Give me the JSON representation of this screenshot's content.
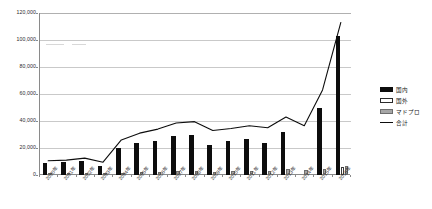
{
  "chart_data": {
    "type": "bar",
    "title": "",
    "subtitle": "",
    "xlabel": "",
    "ylabel": "",
    "ylim": [
      0,
      120000
    ],
    "ytick_step": 20000,
    "ytick_labels": [
      "0",
      "20,000",
      "40,000",
      "60,000",
      "80,000",
      "100,000",
      "120,000"
    ],
    "ytick_values": [
      0,
      20000,
      40000,
      60000,
      80000,
      100000,
      120000
    ],
    "grid": true,
    "grid_axis": "y",
    "legend_position": "right",
    "categories": [
      "2000年",
      "2001年",
      "2002年",
      "2003年",
      "2004年",
      "2005年",
      "2006年",
      "2007年",
      "2008年",
      "2009年",
      "2010年",
      "2011年",
      "2012年",
      "2013年",
      "2014年",
      "2015年",
      "2016年"
    ],
    "series": [
      {
        "name": "国内",
        "kind": "bar",
        "color": "#0d0d0d",
        "values": [
          9000,
          9500,
          10500,
          6500,
          20000,
          24000,
          25500,
          29000,
          30000,
          22000,
          25000,
          26500,
          23500,
          32000,
          0,
          50000,
          103000
        ]
      },
      {
        "name": "国外",
        "kind": "bar",
        "color": "#ffffff",
        "values": [
          0,
          0,
          0,
          0,
          0,
          0,
          0,
          0,
          0,
          0,
          0,
          0,
          0,
          0,
          0,
          0,
          6000
        ]
      },
      {
        "name": "マドプロ",
        "kind": "bar",
        "color": "#a6a6a6",
        "values": [
          1200,
          1300,
          1400,
          1500,
          1800,
          2200,
          2400,
          2600,
          2700,
          2500,
          2600,
          2800,
          3000,
          4500,
          3500,
          4200,
          7000
        ]
      },
      {
        "name": "合計",
        "kind": "line",
        "color": "#0d0d0d",
        "values": [
          10500,
          11000,
          12500,
          9500,
          26000,
          31000,
          34000,
          38500,
          39500,
          33000,
          34500,
          36500,
          35000,
          43000,
          36500,
          63000,
          113000
        ]
      }
    ]
  },
  "legend": {
    "items": [
      {
        "label": "国内",
        "swatch": "filled-black-square"
      },
      {
        "label": "国外",
        "swatch": "outline-white-square"
      },
      {
        "label": "マドプロ",
        "swatch": "filled-gray-square"
      },
      {
        "label": "合計",
        "swatch": "black-line"
      }
    ]
  },
  "colors": {
    "domestic": "#0d0d0d",
    "foreign": "#ffffff",
    "madopro": "#a6a6a6",
    "total_line": "#0d0d0d",
    "grid": "#c9c9c9",
    "axis": "#8a8a8a",
    "background": "#ffffff"
  }
}
